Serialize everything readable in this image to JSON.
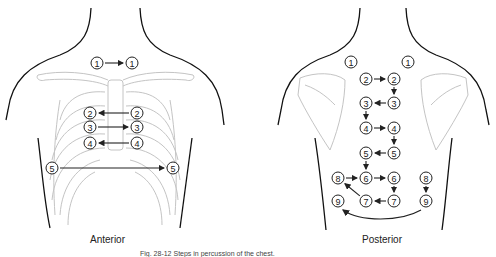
{
  "figure": {
    "caption": "Fig. 28-12 Steps in percussion of the chest.",
    "colors": {
      "outline": "#111111",
      "bone": "#bfbfbf",
      "marker": "#222222"
    }
  },
  "anterior": {
    "label": "Anterior",
    "points": [
      {
        "n": "1",
        "x": 97,
        "y": 63
      },
      {
        "n": "1",
        "x": 132,
        "y": 63
      },
      {
        "n": "2",
        "x": 90,
        "y": 113
      },
      {
        "n": "2",
        "x": 137,
        "y": 113
      },
      {
        "n": "3",
        "x": 90,
        "y": 127
      },
      {
        "n": "3",
        "x": 137,
        "y": 127
      },
      {
        "n": "4",
        "x": 90,
        "y": 143
      },
      {
        "n": "4",
        "x": 137,
        "y": 143
      },
      {
        "n": "5",
        "x": 52,
        "y": 168
      },
      {
        "n": "5",
        "x": 173,
        "y": 168
      }
    ],
    "arrows": [
      {
        "from": 0,
        "to": 1
      },
      {
        "from": 3,
        "to": 2
      },
      {
        "from": 4,
        "to": 5
      },
      {
        "from": 7,
        "to": 6
      },
      {
        "from": 8,
        "to": 9
      }
    ]
  },
  "posterior": {
    "label": "Posterior",
    "points": [
      {
        "n": "1",
        "x": 351,
        "y": 62
      },
      {
        "n": "1",
        "x": 408,
        "y": 62
      },
      {
        "n": "2",
        "x": 366,
        "y": 79
      },
      {
        "n": "2",
        "x": 394,
        "y": 79
      },
      {
        "n": "3",
        "x": 366,
        "y": 103
      },
      {
        "n": "3",
        "x": 394,
        "y": 103
      },
      {
        "n": "4",
        "x": 366,
        "y": 128
      },
      {
        "n": "4",
        "x": 394,
        "y": 128
      },
      {
        "n": "5",
        "x": 366,
        "y": 153
      },
      {
        "n": "5",
        "x": 394,
        "y": 153
      },
      {
        "n": "8",
        "x": 338,
        "y": 178
      },
      {
        "n": "6",
        "x": 366,
        "y": 178
      },
      {
        "n": "6",
        "x": 394,
        "y": 178
      },
      {
        "n": "8",
        "x": 426,
        "y": 178
      },
      {
        "n": "9",
        "x": 338,
        "y": 201
      },
      {
        "n": "7",
        "x": 366,
        "y": 201
      },
      {
        "n": "7",
        "x": 394,
        "y": 201
      },
      {
        "n": "9",
        "x": 426,
        "y": 201
      }
    ],
    "arrows": [
      {
        "from": 2,
        "to": 3
      },
      {
        "from": 3,
        "to": 5
      },
      {
        "from": 5,
        "to": 4
      },
      {
        "from": 4,
        "to": 6
      },
      {
        "from": 6,
        "to": 7
      },
      {
        "from": 7,
        "to": 9
      },
      {
        "from": 9,
        "to": 8
      },
      {
        "from": 8,
        "to": 11
      },
      {
        "from": 10,
        "to": 11
      },
      {
        "from": 11,
        "to": 12
      },
      {
        "from": 12,
        "to": 16
      },
      {
        "from": 16,
        "to": 15
      },
      {
        "from": 15,
        "to": 10
      },
      {
        "from": 13,
        "to": 17
      }
    ]
  }
}
